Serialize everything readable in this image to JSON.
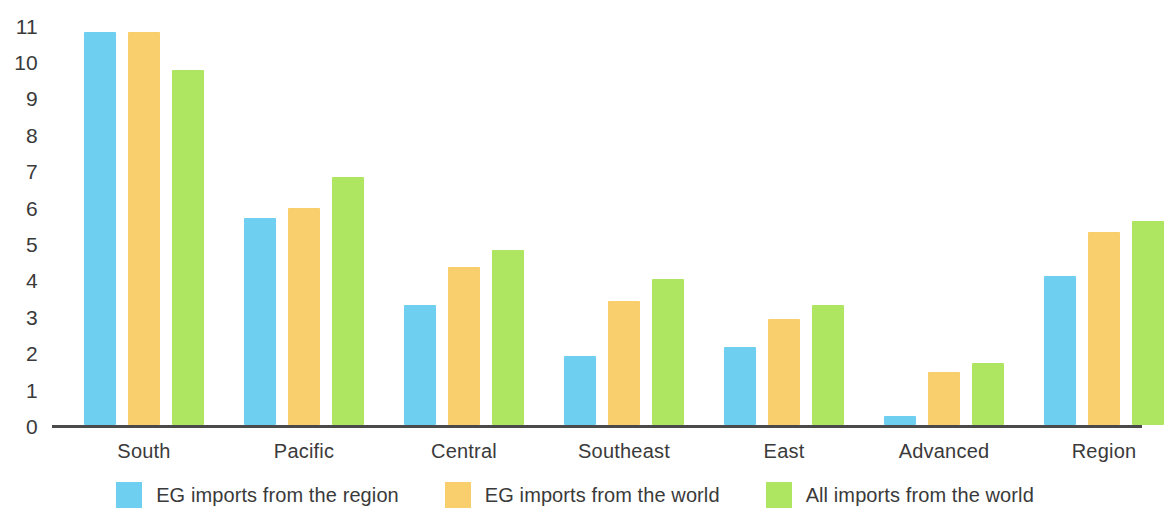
{
  "chart_data": {
    "type": "bar",
    "title": "",
    "subtitle": "",
    "xlabel": "",
    "ylabel": "",
    "ylim": [
      0,
      11
    ],
    "y_ticks": [
      0,
      1,
      2,
      3,
      4,
      5,
      6,
      7,
      8,
      9,
      10,
      11
    ],
    "grid": false,
    "legend_position": "bottom",
    "categories": [
      "South",
      "Pacific",
      "Central",
      "Southeast",
      "East",
      "Advanced",
      "Region"
    ],
    "series": [
      {
        "name": "EG imports from the region",
        "color": "#6FCFF0",
        "values": [
          10.8,
          5.7,
          3.3,
          1.9,
          2.15,
          0.25,
          4.1
        ]
      },
      {
        "name": "EG imports from the world",
        "color": "#F9CE6C",
        "values": [
          10.8,
          5.95,
          4.35,
          3.4,
          2.9,
          1.45,
          5.3
        ]
      },
      {
        "name": "All imports from the world",
        "color": "#AEE661",
        "values": [
          9.75,
          6.8,
          4.8,
          4.0,
          3.3,
          1.7,
          5.6
        ]
      }
    ]
  },
  "axis": {
    "baseline_color": "#4a4a4a",
    "tick_text_color": "#3a3a3a"
  }
}
